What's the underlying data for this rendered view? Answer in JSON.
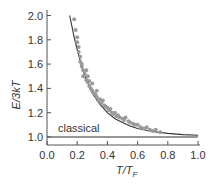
{
  "chart_data": {
    "type": "scatter",
    "title": "",
    "xlabel": "T/T_F",
    "ylabel": "E/3kT",
    "xlim": [
      0.0,
      1.0
    ],
    "ylim": [
      1.0,
      2.0
    ],
    "grid": false,
    "legend": null,
    "x_ticks": [
      "0.0",
      "0.2",
      "0.4",
      "0.6",
      "0.8",
      "1.0"
    ],
    "y_ticks": [
      "1.0",
      "1.2",
      "1.4",
      "1.6",
      "1.8",
      "2.0"
    ],
    "annotations": [
      {
        "text": "classical",
        "x": 0.05,
        "y": 1.05
      }
    ],
    "series": [
      {
        "name": "theory (Fermi gas)",
        "kind": "line",
        "color": "#333333",
        "x": [
          0.15,
          0.18,
          0.2,
          0.23,
          0.25,
          0.28,
          0.3,
          0.35,
          0.4,
          0.45,
          0.5,
          0.55,
          0.6,
          0.7,
          0.8,
          0.9,
          1.0
        ],
        "y": [
          2.0,
          1.82,
          1.72,
          1.58,
          1.5,
          1.42,
          1.36,
          1.27,
          1.2,
          1.15,
          1.12,
          1.09,
          1.07,
          1.045,
          1.03,
          1.02,
          1.015
        ]
      },
      {
        "name": "classical",
        "kind": "line",
        "color": "#333333",
        "x": [
          0.0,
          1.0
        ],
        "y": [
          1.0,
          1.0
        ]
      },
      {
        "name": "experiment",
        "kind": "scatter",
        "color": "#9a9a9a",
        "x": [
          0.18,
          0.19,
          0.2,
          0.2,
          0.21,
          0.21,
          0.22,
          0.22,
          0.23,
          0.23,
          0.24,
          0.24,
          0.25,
          0.26,
          0.26,
          0.27,
          0.27,
          0.28,
          0.28,
          0.29,
          0.3,
          0.3,
          0.31,
          0.32,
          0.33,
          0.33,
          0.34,
          0.35,
          0.36,
          0.37,
          0.38,
          0.39,
          0.4,
          0.41,
          0.42,
          0.43,
          0.44,
          0.45,
          0.46,
          0.47,
          0.48,
          0.5,
          0.51,
          0.52,
          0.54,
          0.55,
          0.57,
          0.58,
          0.6,
          0.62,
          0.64,
          0.66,
          0.68,
          0.7,
          0.72,
          0.75
        ],
        "y": [
          1.97,
          1.88,
          1.82,
          1.78,
          1.74,
          1.7,
          1.66,
          1.62,
          1.58,
          1.6,
          1.55,
          1.5,
          1.52,
          1.47,
          1.55,
          1.45,
          1.5,
          1.42,
          1.46,
          1.4,
          1.38,
          1.44,
          1.36,
          1.35,
          1.33,
          1.38,
          1.3,
          1.31,
          1.28,
          1.3,
          1.26,
          1.25,
          1.24,
          1.22,
          1.23,
          1.2,
          1.19,
          1.2,
          1.17,
          1.18,
          1.16,
          1.15,
          1.14,
          1.16,
          1.13,
          1.12,
          1.11,
          1.1,
          1.1,
          1.08,
          1.07,
          1.08,
          1.06,
          1.05,
          1.06,
          1.04
        ]
      }
    ]
  },
  "axes": {
    "x_label_main": "T",
    "x_label_slash": "/",
    "x_label_denom": "T",
    "x_label_sub": "F",
    "y_label": "E/3kT",
    "classical_label": "classical"
  }
}
